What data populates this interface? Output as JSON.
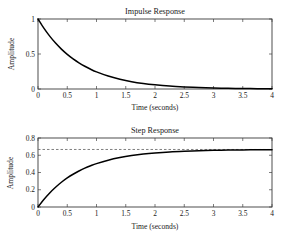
{
  "figure": {
    "background": "#ffffff",
    "curve_color": "#000000",
    "axis_color": "#3a3a3a",
    "reference_line_color": "#707070"
  },
  "chart_data": [
    {
      "type": "line",
      "title": "Impulse Response",
      "xlabel": "Time (seconds)",
      "ylabel": "Amplitude",
      "xlim": [
        0,
        4
      ],
      "ylim": [
        0,
        1
      ],
      "grid": false,
      "legend": null,
      "xticks": [
        0,
        0.5,
        1,
        1.5,
        2,
        2.5,
        3,
        3.5,
        4
      ],
      "xticklabels": [
        "0",
        "0.5",
        "1",
        "1.5",
        "2",
        "2.5",
        "3",
        "3.5",
        "4"
      ],
      "yticks": [
        0,
        0.5,
        1
      ],
      "yticklabels": [
        "0",
        "0.5",
        "1"
      ],
      "series": [
        {
          "name": "impulse",
          "x": [
            0,
            0.1,
            0.2,
            0.3,
            0.4,
            0.5,
            0.6,
            0.7,
            0.8,
            0.9,
            1.0,
            1.2,
            1.4,
            1.6,
            1.8,
            2.0,
            2.25,
            2.5,
            2.75,
            3.0,
            3.25,
            3.5,
            3.75,
            4.0
          ],
          "y": [
            1.0,
            0.869,
            0.755,
            0.656,
            0.57,
            0.495,
            0.43,
            0.374,
            0.325,
            0.282,
            0.245,
            0.185,
            0.14,
            0.105,
            0.079,
            0.06,
            0.042,
            0.03,
            0.021,
            0.015,
            0.01,
            0.007,
            0.005,
            0.004
          ]
        }
      ]
    },
    {
      "type": "line",
      "title": "Step Response",
      "xlabel": "Time (seconds)",
      "ylabel": "Amplitude",
      "xlim": [
        0,
        4
      ],
      "ylim": [
        0,
        0.8
      ],
      "grid": false,
      "legend": null,
      "xticks": [
        0,
        0.5,
        1,
        1.5,
        2,
        2.5,
        3,
        3.5,
        4
      ],
      "xticklabels": [
        "0",
        "0.5",
        "1",
        "1.5",
        "2",
        "2.5",
        "3",
        "3.5",
        "4"
      ],
      "yticks": [
        0,
        0.2,
        0.4,
        0.6,
        0.8
      ],
      "yticklabels": [
        "0",
        "0.2",
        "0.4",
        "0.6",
        "0.8"
      ],
      "reference_line": {
        "value": 0.667,
        "style": "dashed"
      },
      "series": [
        {
          "name": "step",
          "x": [
            0,
            0.1,
            0.2,
            0.3,
            0.4,
            0.5,
            0.6,
            0.7,
            0.8,
            0.9,
            1.0,
            1.2,
            1.4,
            1.6,
            1.8,
            2.0,
            2.25,
            2.5,
            2.75,
            3.0,
            3.25,
            3.5,
            3.75,
            4.0
          ],
          "y": [
            0.0,
            0.087,
            0.163,
            0.229,
            0.287,
            0.337,
            0.38,
            0.417,
            0.45,
            0.478,
            0.503,
            0.543,
            0.573,
            0.596,
            0.614,
            0.627,
            0.639,
            0.647,
            0.653,
            0.657,
            0.66,
            0.662,
            0.664,
            0.665
          ]
        }
      ]
    }
  ]
}
